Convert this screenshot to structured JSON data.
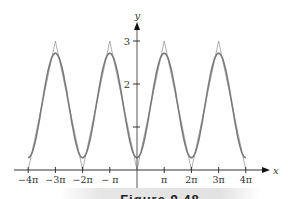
{
  "chart_data": {
    "type": "line",
    "title": "",
    "xlabel": "x",
    "ylabel": "y",
    "xlim": [
      -12.566,
      12.566
    ],
    "ylim": [
      0,
      3.3
    ],
    "x_ticks": [
      {
        "value": -12.566,
        "label": "−4π"
      },
      {
        "value": -9.425,
        "label": "−3π"
      },
      {
        "value": -6.283,
        "label": "−2π"
      },
      {
        "value": -3.1416,
        "label": "− π"
      },
      {
        "value": 3.1416,
        "label": "π"
      },
      {
        "value": 6.283,
        "label": "2π"
      },
      {
        "value": 9.425,
        "label": "3π"
      },
      {
        "value": 12.566,
        "label": "4π"
      }
    ],
    "y_ticks": [
      {
        "value": 1,
        "label": ""
      },
      {
        "value": 2,
        "label": "2"
      },
      {
        "value": 3,
        "label": "3"
      }
    ],
    "grid": false,
    "legend": null,
    "series": [
      {
        "name": "triangle wave f(x) = 3|x|/π on [−π, π], periodic",
        "style": "thin light gray",
        "x": [
          -12.566,
          -9.425,
          -6.283,
          -3.1416,
          0,
          3.1416,
          6.283,
          9.425,
          12.566
        ],
        "values": [
          0,
          3,
          0,
          3,
          0,
          3,
          0,
          3,
          0
        ]
      },
      {
        "name": "Fourier approximation 3/2 − (12/π²)cos x",
        "style": "thicker gray, smooth",
        "x": [
          -12.566,
          -9.425,
          -6.283,
          -3.1416,
          0,
          3.1416,
          6.283,
          9.425,
          12.566
        ],
        "values": [
          0.28,
          2.72,
          0.28,
          2.72,
          0.28,
          2.72,
          0.28,
          2.72,
          0.28
        ]
      }
    ]
  },
  "axes": {
    "x_label": "x",
    "y_label": "y"
  },
  "caption": "Figure 9.48"
}
